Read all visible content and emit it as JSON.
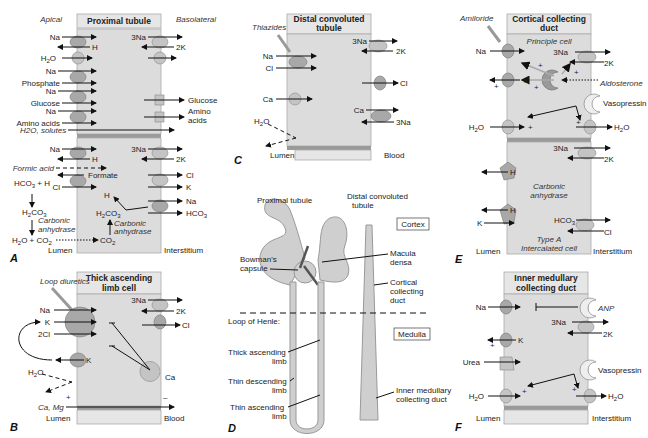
{
  "panels": {
    "A": {
      "letter": "A",
      "title": "Proximal tubule",
      "side_left": "Apical",
      "side_right": "Basolateral",
      "bottom_left": "Lumen",
      "bottom_right": "Interstitium",
      "upper_cell": {
        "apical": [
          "Na",
          "H",
          "H2O",
          "Na",
          "Phosphate",
          "Na",
          "Glucose",
          "Na",
          "Amino acids"
        ],
        "basolateral": [
          "3Na",
          "2K",
          "Glucose",
          "Amino acids"
        ],
        "paracellular": "H2O, solutes"
      },
      "lower_cell": {
        "apical": [
          "Na",
          "H",
          "Formic acid",
          "Formate",
          "Cl"
        ],
        "lumen_reactions": [
          "HCO3 + H",
          "H2CO3",
          "Carbonic anhydrase",
          "H2O + CO2"
        ],
        "intracellular": [
          "H",
          "H2CO3",
          "Carbonic anhydrase",
          "CO2"
        ],
        "basolateral": [
          "3Na",
          "2K",
          "Cl",
          "K",
          "Na",
          "HCO3"
        ]
      }
    },
    "B": {
      "letter": "B",
      "title_line1": "Thick ascending",
      "title_line2": "limb cell",
      "drug": "Loop diuretics",
      "apical": [
        "Na",
        "K",
        "2Cl",
        "K",
        "H2O"
      ],
      "basolateral": [
        "3Na",
        "2K",
        "Cl",
        "Ca"
      ],
      "paracellular": "Ca, Mg",
      "charge_left": "+",
      "charge_right": "–",
      "bottom_left": "Lumen",
      "bottom_right": "Blood"
    },
    "C": {
      "letter": "C",
      "title_line1": "Distal convoluted",
      "title_line2": "tubule",
      "drug": "Thiazides",
      "apical": [
        "Na",
        "Cl",
        "Ca",
        "H2O"
      ],
      "basolateral": [
        "3Na",
        "2K",
        "Cl",
        "Ca",
        "3Na"
      ],
      "bottom_left": "Lumen",
      "bottom_right": "Blood"
    },
    "D": {
      "letter": "D",
      "labels": {
        "proximal_tubule": "Proximal tubule",
        "distal_line1": "Distal convoluted",
        "distal_line2": "tubule",
        "cortex": "Cortex",
        "medulla": "Medulla",
        "bowman_line1": "Bowman's",
        "bowman_line2": "capsule",
        "macula_line1": "Macula",
        "macula_line2": "densa",
        "ccd_line1": "Cortical",
        "ccd_line2": "collecting",
        "ccd_line3": "duct",
        "loop": "Loop of Henle:",
        "thick_line1": "Thick ascending",
        "thick_line2": "limb",
        "thin_desc_line1": "Thin descending",
        "thin_desc_line2": "limb",
        "thin_asc_line1": "Thin ascending",
        "thin_asc_line2": "limb",
        "imcd_line1": "Inner medullary",
        "imcd_line2": "collecting duct"
      }
    },
    "E": {
      "letter": "E",
      "title_line1": "Cortical collecting",
      "title_line2": "duct",
      "drug": "Amiloride",
      "principal_cell": "Principle cell",
      "principal": {
        "apical": [
          "Na",
          "K",
          "H2O"
        ],
        "basolateral": [
          "3Na",
          "2K",
          "H2O"
        ],
        "hormones": [
          "Aldosterone",
          "Vasopressin"
        ]
      },
      "intercalated_cell_line1": "Type A",
      "intercalated_cell_line2": "Intercalated cell",
      "intercalated": {
        "apical": [
          "H",
          "H",
          "K"
        ],
        "intracellular": [
          "Carbonic",
          "anhydrase"
        ],
        "basolateral": [
          "3Na",
          "2K",
          "HCO3",
          "Cl"
        ]
      },
      "bottom_left": "Lumen",
      "bottom_right": "Interstitium"
    },
    "F": {
      "letter": "F",
      "title_line1": "Inner medullary",
      "title_line2": "collecting duct",
      "apical": [
        "Na",
        "K",
        "Urea",
        "H2O"
      ],
      "basolateral": [
        "3Na",
        "2K",
        "H2O"
      ],
      "hormones": [
        "ANP",
        "Vasopressin"
      ],
      "bottom_left": "Lumen",
      "bottom_right": "Interstitium"
    }
  }
}
